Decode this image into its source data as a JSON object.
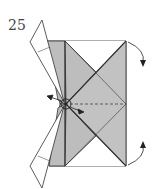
{
  "diagram": {
    "step_number": "25",
    "fill_color": "#bdbdbd",
    "line_color": "#333333",
    "arrows": [
      "curved-arrow-top-right-down",
      "curved-arrow-bottom-right-up",
      "push-arrow-left",
      "push-arrow-right"
    ],
    "symbols": [
      "pivot-circle"
    ]
  }
}
